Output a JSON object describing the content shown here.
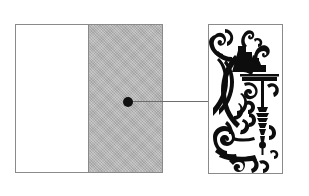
{
  "figure": {
    "background_color": "#ffffff",
    "caption": "",
    "panels": [
      {
        "id": "plan-rect",
        "name": "schematic-plan-rectangle",
        "role": "overview",
        "fill": "#ffffff",
        "stroke": "#8a8a8a",
        "x": 15,
        "y": 24,
        "width": 148,
        "height": 149
      },
      {
        "id": "plan-shaded",
        "name": "shaded-region",
        "role": "highlighted-area",
        "fill": "#b4b4b4",
        "stroke": "#8a8a8a",
        "texture": "fine-dither-halftone",
        "x": 88,
        "y": 24,
        "width": 75,
        "height": 149
      },
      {
        "id": "detail-panel",
        "name": "enlarged-detail-panel",
        "role": "detail",
        "fill": "#ffffff",
        "stroke": "#8a8a8a",
        "x": 208,
        "y": 24,
        "width": 75,
        "height": 150,
        "content": "baroque-rococo-ornamental-scrollwork"
      }
    ],
    "callout": {
      "name": "detail-callout",
      "marker_color": "#111111",
      "marker_radius": 5,
      "marker_x": 128,
      "marker_y": 102,
      "line_color": "#6d6d6d",
      "line_from_x": 128,
      "line_to_x": 208,
      "line_y": 102,
      "label": ""
    },
    "ornament": {
      "name": "ornament-engraving",
      "ink_color": "#0d0d0d",
      "style": "foliate scroll with stepped cornice, pendant tassel and acanthus curls",
      "motifs": [
        "acanthus-scroll",
        "stepped-cornice",
        "horizontal-ledge-bar",
        "hanging-pendant-tassel",
        "volute-curl"
      ]
    }
  }
}
